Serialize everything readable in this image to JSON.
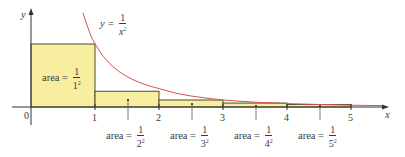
{
  "figure": {
    "colors": {
      "fill": "#f7ef9f",
      "rect_stroke": "#4a4a30",
      "curve": "#d9534f",
      "axis": "#333333"
    },
    "axes": {
      "x_label": "x",
      "y_label": "y",
      "origin_label": "0",
      "x_ticks": [
        "1",
        "2",
        "3",
        "4",
        "5"
      ]
    },
    "curve_label": {
      "lhs": "y =",
      "num": "1",
      "den_base": "x",
      "den_exp": "2"
    },
    "rect_labels": [
      {
        "prefix": "area =",
        "num": "1",
        "den_base": "1",
        "den_exp": "2"
      },
      {
        "prefix": "area =",
        "num": "1",
        "den_base": "2",
        "den_exp": "2"
      },
      {
        "prefix": "area =",
        "num": "1",
        "den_base": "3",
        "den_exp": "2"
      },
      {
        "prefix": "area =",
        "num": "1",
        "den_base": "4",
        "den_exp": "2"
      },
      {
        "prefix": "area =",
        "num": "1",
        "den_base": "5",
        "den_exp": "2"
      }
    ]
  }
}
